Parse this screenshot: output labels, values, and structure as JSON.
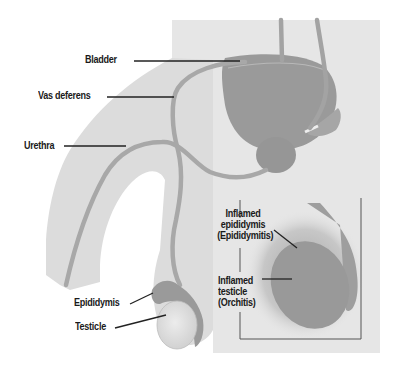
{
  "diagram": {
    "type": "anatomical-illustration",
    "labels": {
      "bladder": "Bladder",
      "vas_deferens": "Vas deferens",
      "urethra": "Urethra",
      "epididymis": "Epididymis",
      "testicle": "Testicle"
    },
    "inset": {
      "inflamed_epididymis": [
        "Inflamed",
        "epididymis",
        "(Epididymitis)"
      ],
      "inflamed_testicle": [
        "Inflamed",
        "testicle",
        "(Orchitis)"
      ]
    },
    "colors": {
      "background": "#ffffff",
      "panel": "#e6e6e6",
      "body": "#dcdcdc",
      "organ": "#9a9a9a",
      "organ_dark": "#8c8c8c",
      "testicle": "#e2e2e2",
      "leader_line": "#222222",
      "inset_frame": "#555555"
    }
  }
}
